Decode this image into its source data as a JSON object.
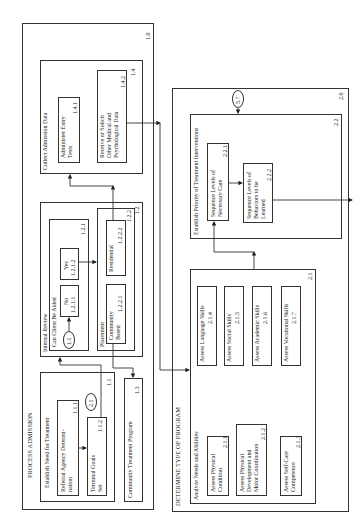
{
  "sections": {
    "process_admission": {
      "title": "PROCESS ADMISSION",
      "number": "1.0",
      "establish_need": {
        "title": "Establish Need for Treatment",
        "number": "1.1",
        "referral": {
          "label": "Referral Agency Determi-nation",
          "line1": "Referral Agency Determi-",
          "line2": "nation",
          "number": "1.1.1"
        },
        "terminal_goals": {
          "line1": "Terminal Goals",
          "line2": "Set",
          "number": "1.1.2"
        },
        "connector": "2.1"
      },
      "internal_review": {
        "title": "Internal Review",
        "number": "1.2",
        "can_client": {
          "title": "Can Client Be Aided",
          "number": "1.2.1",
          "no": {
            "label": "No",
            "number": "1.2.1.1"
          },
          "yes": {
            "label": "Yes",
            "number": "1.2.1.2"
          },
          "connector": "1.1"
        },
        "placement": {
          "title": "Placement",
          "number": "1.2.2",
          "community": {
            "line1": "Community",
            "line2": "Based",
            "number": "1.2.2.1"
          },
          "residential": {
            "label": "Residential",
            "number": "1.2.2.2"
          }
        }
      },
      "community_program": {
        "label": "Community Treatment Program",
        "number": "1.3"
      },
      "collect_data": {
        "title": "Collect Admission Data",
        "number": "1.4",
        "entry_tests": {
          "line1": "Administer Entry",
          "line2": "Tests",
          "number": "1.4.1"
        },
        "other_data": {
          "line1": "Receive or Solicit",
          "line2": "Other Medical and",
          "line3": "Psychological Data",
          "number": "1.4.2"
        }
      }
    },
    "determine_program": {
      "title": "DETERMINE TYPE OF PROGRAM",
      "number": "2.0",
      "analyze": {
        "title": "Analyze Needs and Abilities",
        "number": "2.1",
        "physical": {
          "line1": "Assess Physical",
          "line2": "Condition",
          "number": "2.1.1"
        },
        "motor": {
          "line1": "Assess Physical",
          "line2": "Development and",
          "line3": "Motor Coordination",
          "number": "2.1.2"
        },
        "self_care": {
          "line1": "Assess Self-Care",
          "line2": "Competence",
          "number": "2.1.3"
        },
        "language": {
          "label": "Assess Language Skills",
          "number": "2.1.4"
        },
        "social": {
          "label": "Assess Social Skills",
          "number": "2.1.5"
        },
        "academic": {
          "label": "Assess Academic Skills",
          "number": "2.1.6"
        },
        "vocational": {
          "label": "Assess Vocational Skills",
          "number": "2.1.7"
        }
      },
      "priority": {
        "title": "Establish Priority of Treatment Interventions",
        "number": "2.2",
        "necessary_care": {
          "line1": "Sequence Levels of",
          "line2": "Necessary Care",
          "number": "2.2.1"
        },
        "behaviors": {
          "line1": "Sequence Levels of",
          "line2": "Behaviors to be",
          "line3": "Learned",
          "number": "2.2.2"
        },
        "connector": "5.7"
      }
    }
  }
}
